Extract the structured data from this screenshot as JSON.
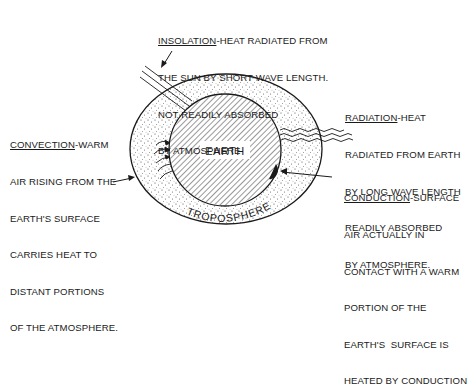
{
  "diagram": {
    "center_label": "EARTH",
    "layer_label": "TROPOSPHERE",
    "colors": {
      "ink": "#1a1a1a",
      "background": "#ffffff"
    }
  },
  "labels": {
    "insolation": {
      "term": "INSOLATION",
      "line1": "-HEAT RADIATED FROM",
      "line2": "THE SUN BY SHORT WAVE LENGTH.",
      "line3": "NOT READILY ABSORBED",
      "line4": "BY ATMOSPHERE"
    },
    "convection": {
      "term": "CONVECTION",
      "line1": "-WARM",
      "line2": "AIR RISING FROM THE",
      "line3": "EARTH'S SURFACE",
      "line4": "CARRIES HEAT TO",
      "line5": "DISTANT PORTIONS",
      "line6": "OF THE ATMOSPHERE."
    },
    "radiation": {
      "term": "RADIATION",
      "line1": "-HEAT",
      "line2": "RADIATED FROM EARTH",
      "line3": "BY LONG WAVE LENGTH",
      "line4": "READILY ABSORBED",
      "line5": "BY ATMOSPHERE."
    },
    "conduction": {
      "term": "CONDUCTION",
      "line1": "-SURFACE",
      "line2": "AIR ACTUALLY IN",
      "line3": "CONTACT WITH A WARM",
      "line4": "PORTION OF THE",
      "line5": "EARTH'S  SURFACE IS",
      "line6": "HEATED BY CONDUCTION"
    }
  }
}
